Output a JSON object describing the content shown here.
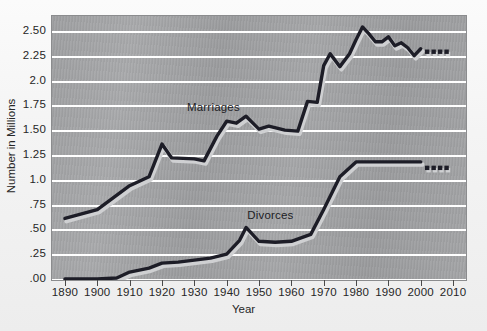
{
  "chart_data": {
    "type": "line",
    "title": "",
    "xlabel": "Year",
    "ylabel": "Number in Millions",
    "xlim": [
      1886,
      2014
    ],
    "ylim": [
      0.0,
      2.66
    ],
    "grid": true,
    "legend_position": "inline-labels",
    "xticks": [
      "1890",
      "1900",
      "1910",
      "1920",
      "1930",
      "1940",
      "1950",
      "1960",
      "1970",
      "1980",
      "1990",
      "2000",
      "2010"
    ],
    "xtick_values": [
      1890,
      1900,
      1910,
      1920,
      1930,
      1940,
      1950,
      1960,
      1970,
      1980,
      1990,
      2000,
      2010
    ],
    "yticks": [
      "2.50",
      "2.25",
      "2.0",
      "1.75",
      "1.50",
      "1.25",
      "1.0",
      ".75",
      ".50",
      ".25",
      ".00"
    ],
    "ytick_values": [
      2.5,
      2.25,
      2.0,
      1.75,
      1.5,
      1.25,
      1.0,
      0.75,
      0.5,
      0.25,
      0.0
    ],
    "series": [
      {
        "name": "Marriages",
        "label_x": 1937,
        "label_y": 1.72,
        "color": "#1d1d27",
        "x": [
          1890,
          1900,
          1910,
          1916,
          1920,
          1923,
          1930,
          1933,
          1937,
          1940,
          1943,
          1946,
          1950,
          1953,
          1958,
          1962,
          1965,
          1968,
          1970,
          1972,
          1975,
          1978,
          1980,
          1982,
          1984,
          1986,
          1988,
          1990,
          1992,
          1994,
          1996,
          1998,
          2000
        ],
        "y": [
          0.62,
          0.71,
          0.95,
          1.04,
          1.37,
          1.23,
          1.22,
          1.2,
          1.45,
          1.6,
          1.58,
          1.65,
          1.52,
          1.55,
          1.51,
          1.5,
          1.8,
          1.79,
          2.16,
          2.28,
          2.15,
          2.28,
          2.42,
          2.55,
          2.48,
          2.4,
          2.4,
          2.45,
          2.36,
          2.39,
          2.34,
          2.26,
          2.33
        ],
        "projected_x": [
          2002,
          2004,
          2006,
          2008
        ],
        "projected_y": [
          2.3,
          2.3,
          2.3,
          2.3
        ],
        "projection_style": "dotted-squares"
      },
      {
        "name": "Divorces",
        "label_x": 1955,
        "label_y": 0.63,
        "color": "#1d1d27",
        "x": [
          1890,
          1900,
          1906,
          1910,
          1916,
          1920,
          1925,
          1930,
          1935,
          1940,
          1944,
          1946,
          1950,
          1955,
          1960,
          1966,
          1970,
          1975,
          1980,
          1985,
          1990,
          1995,
          2000
        ],
        "y": [
          0.01,
          0.01,
          0.02,
          0.08,
          0.12,
          0.17,
          0.18,
          0.2,
          0.22,
          0.26,
          0.4,
          0.53,
          0.39,
          0.38,
          0.39,
          0.46,
          0.71,
          1.04,
          1.19,
          1.19,
          1.19,
          1.19,
          1.19
        ],
        "projected_x": [
          2002,
          2004,
          2006,
          2008
        ],
        "projected_y": [
          1.13,
          1.13,
          1.13,
          1.13
        ],
        "projection_style": "dotted-squares"
      }
    ]
  },
  "colors": {
    "plot_background": "#a2a3a5",
    "figure_background": "#f5f5f5",
    "gridline": "#ffffff",
    "line": "#1d1d27",
    "line_shadow": "#cfd0d2",
    "tick_text": "#262626"
  }
}
